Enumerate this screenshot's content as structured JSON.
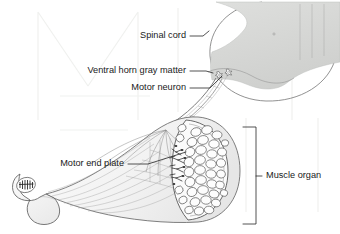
{
  "figure": {
    "background_color": "#ffffff",
    "width": 340,
    "height": 234
  },
  "labels": [
    {
      "id": "spinal-cord",
      "text": "Spinal cord",
      "anchor": "end",
      "x": 186,
      "y": 36,
      "leader": "M 190 36 L 203 36 L 209 31"
    },
    {
      "id": "ventral-horn-gray-matter",
      "text": "Ventral horn gray matter",
      "anchor": "end",
      "x": 186,
      "y": 71,
      "leader": "M 190 71 L 206 71 L 213 73"
    },
    {
      "id": "motor-neuron",
      "text": "Motor neuron",
      "anchor": "end",
      "x": 186,
      "y": 88,
      "leader": "M 190 88 L 210 88 L 222 76"
    },
    {
      "id": "motor-end-plate",
      "text": "Motor end plate",
      "anchor": "end",
      "x": 124,
      "y": 164,
      "leader": "M 128 164 L 148 164 L 186 152"
    },
    {
      "id": "muscle-organ",
      "text": "Muscle organ",
      "anchor": "start",
      "x": 266,
      "y": 176,
      "leader": "M 262 176 L 256 176"
    }
  ],
  "brackets": [
    {
      "id": "muscle-organ-bracket",
      "label_ref": "muscle-organ",
      "path": "M 243 127 L 256 127 L 256 224 L 243 224"
    }
  ],
  "structures": {
    "spinal_cord": {
      "name": "spinal-cord-cross-section",
      "gray_matter_color": "#d9dad8",
      "outline_color": "#9a9a9a",
      "description": "Circular cord cross-section with butterfly-shaped gray matter and a dorsal marker dot"
    },
    "motor_neurons": {
      "name": "motor-neuron-cell-bodies",
      "count": 2,
      "shape": "multipolar star",
      "positions": [
        [
          219,
          75
        ],
        [
          228,
          73
        ]
      ]
    },
    "nerve": {
      "name": "motor-nerve-axon-bundle",
      "description": "Axon bundle leaving ventral horn, descending to muscle and fanning into branches"
    },
    "muscle_organ": {
      "name": "muscle-organ",
      "fill": "#f4f4f4",
      "outline_color": "#5f5f5f",
      "fiber_count": 37,
      "description": "Conical muscle belly shown in cut cross-section with packed muscle fibers"
    },
    "motor_end_plates": {
      "name": "motor-end-plate-cluster",
      "description": "Dark branched terminal arborizations on fibers near the cut face"
    },
    "bone": {
      "name": "bone-with-marrow",
      "description": "Bone at lower left where the muscle tendon attaches, shown with hatched marrow cavity"
    },
    "watermark": {
      "name": "background-watermark",
      "color": "#f0f1ef",
      "description": "Very faint large letterform watermark behind the drawing"
    }
  },
  "colors": {
    "label_text": "#1a1a1a",
    "leader_line": "#262626",
    "outline": "#6e6e6e",
    "gray_matter": "#d9dad8",
    "muscle_fill": "#f4f4f4",
    "background": "#ffffff"
  }
}
